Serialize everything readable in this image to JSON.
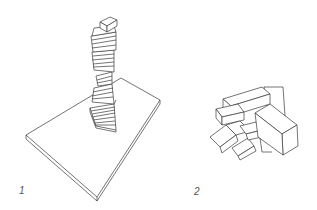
{
  "figures": [
    {
      "label": "1",
      "description": "twisted spiral stack of rectangular blocks on a square slab"
    },
    {
      "label": "2",
      "description": "jumbled pile of rectangular blocks"
    }
  ],
  "colors": {
    "line": "#3a3a3a",
    "background": "#ffffff"
  }
}
